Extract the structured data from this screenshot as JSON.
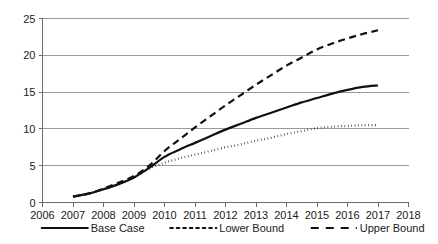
{
  "chart_data": {
    "type": "line",
    "title": "",
    "subtitle": "",
    "xlabel": "",
    "ylabel": "",
    "xlim": [
      2006,
      2018
    ],
    "ylim": [
      0,
      25
    ],
    "grid": true,
    "grid_axis": "y",
    "legend_position": "bottom",
    "x_tick_labels": [
      "2006",
      "2007",
      "2008",
      "2009",
      "2010",
      "2011",
      "2012",
      "2013",
      "2014",
      "2015",
      "2016",
      "2017",
      "2018"
    ],
    "y_tick_labels": [
      "0",
      "5",
      "10",
      "15",
      "20",
      "25"
    ],
    "x_ticks": [
      2006,
      2007,
      2008,
      2009,
      2010,
      2011,
      2012,
      2013,
      2014,
      2015,
      2016,
      2017,
      2018
    ],
    "y_ticks": [
      0,
      5,
      10,
      15,
      20,
      25
    ],
    "x": [
      2007,
      2007.5,
      2008,
      2008.5,
      2009,
      2009.5,
      2010,
      2010.5,
      2011,
      2011.5,
      2012,
      2012.5,
      2013,
      2013.5,
      2014,
      2014.5,
      2015,
      2015.5,
      2016,
      2016.5,
      2017
    ],
    "series": [
      {
        "name": "Base Case",
        "style": "solid",
        "color": "#111111",
        "values": [
          0.8,
          1.2,
          1.8,
          2.5,
          3.4,
          4.7,
          6.2,
          7.2,
          8.1,
          9.0,
          9.9,
          10.7,
          11.5,
          12.2,
          12.9,
          13.6,
          14.2,
          14.8,
          15.3,
          15.7,
          15.9
        ]
      },
      {
        "name": "Lower Bound",
        "style": "dotted",
        "color": "#111111",
        "values": [
          0.8,
          1.2,
          1.8,
          2.5,
          3.4,
          4.6,
          5.4,
          6.0,
          6.5,
          7.0,
          7.5,
          7.9,
          8.4,
          8.8,
          9.3,
          9.7,
          10.1,
          10.3,
          10.4,
          10.5,
          10.5
        ]
      },
      {
        "name": "Upper Bound",
        "style": "dashed",
        "color": "#111111",
        "values": [
          0.8,
          1.2,
          1.9,
          2.7,
          3.6,
          5.0,
          7.0,
          8.6,
          10.2,
          11.7,
          13.2,
          14.6,
          16.0,
          17.3,
          18.6,
          19.7,
          20.8,
          21.6,
          22.3,
          22.9,
          23.4
        ]
      }
    ]
  },
  "legend": {
    "items": [
      {
        "label": "Base Case",
        "style": "solid"
      },
      {
        "label": "Lower Bound",
        "style": "dotted"
      },
      {
        "label": "Upper Bound",
        "style": "dashed"
      }
    ]
  }
}
